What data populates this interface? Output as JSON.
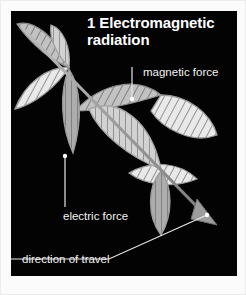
{
  "figure": {
    "number": "1",
    "title": "1 Electromagnetic radiation",
    "title_line_1": "1 Electromagnetic",
    "title_line_2": "radiation",
    "background_color": "#030303",
    "frame_color": "#fbfbfb",
    "text_color": "#ffffff"
  },
  "labels": {
    "magnetic": "magnetic force",
    "electric": "electric force",
    "direction": "direction of travel"
  },
  "colors": {
    "wave_light": "#e8e8e8",
    "wave_mid": "#c9c9c9",
    "wave_dark": "#8f8f8f",
    "hatch_line": "#6a6a6a",
    "outline": "#9a9a9a",
    "leader_line": "#e6e6e6",
    "arrow_fill": "#9d9d9d"
  },
  "diagram": {
    "type": "electromagnetic-wave",
    "axis_start": [
      14,
      22
    ],
    "axis_end": [
      206,
      218
    ],
    "wave_components": [
      {
        "name": "magnetic force",
        "hatching": "diagonal",
        "lobes": 4
      },
      {
        "name": "electric force",
        "hatching": "vertical",
        "lobes": 4
      }
    ],
    "leaders": [
      {
        "name": "magnetic-force-leader",
        "from": [
          131,
          68
        ],
        "to": [
          131,
          98
        ]
      },
      {
        "name": "electric-force-leader",
        "from": [
          65,
          199
        ],
        "to": [
          65,
          154
        ]
      },
      {
        "name": "direction-of-travel-leader",
        "from": [
          11,
          257
        ],
        "to": [
          203,
          213
        ]
      }
    ]
  }
}
